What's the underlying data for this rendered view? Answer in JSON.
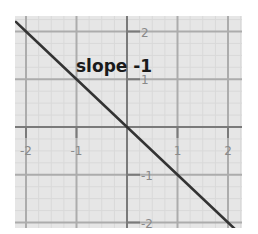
{
  "chart_data": {
    "type": "line",
    "title": "",
    "xlabel": "",
    "ylabel": "",
    "xlim": [
      -2.2,
      2.28
    ],
    "ylim": [
      -2.13,
      2.33
    ],
    "grid": true,
    "x_ticks": [
      -2,
      -1,
      1,
      2
    ],
    "y_ticks": [
      2,
      1,
      -1,
      -2
    ],
    "x_tick_labels": [
      "-2",
      "-1",
      "1",
      "2"
    ],
    "y_tick_labels": [
      "2",
      "1",
      "-1",
      "-2"
    ],
    "series": [
      {
        "name": "y = -x",
        "x": [
          -2.2,
          -2,
          -1,
          0,
          1,
          2,
          2.13
        ],
        "values": [
          2.2,
          2,
          1,
          0,
          -1,
          -2,
          -2.13
        ],
        "color": "#333333"
      }
    ],
    "annotations": [
      {
        "text": "slope -1",
        "x": -1.0,
        "y": 1.2
      }
    ],
    "colors": {
      "background": "#e6e6e6",
      "major_grid": "#acacac",
      "minor_grid": "#d9d9d9",
      "axis": "#7a7a7a",
      "line": "#333333"
    }
  },
  "labels": {
    "annotation": "slope -1"
  }
}
